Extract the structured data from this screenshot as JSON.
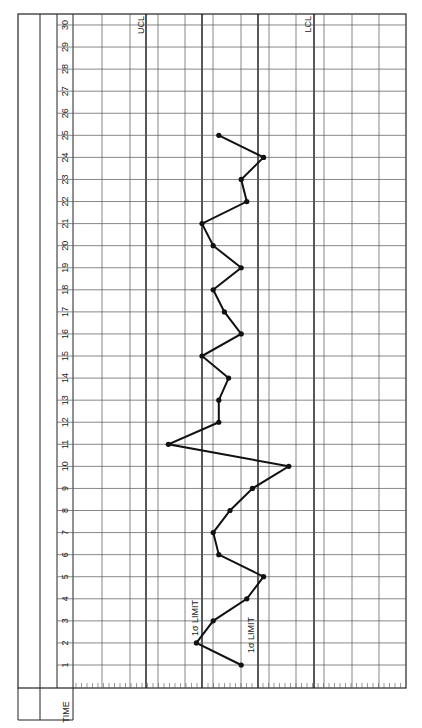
{
  "chart_data": {
    "type": "line",
    "orientation": "rotated-90 (time runs bottom to top, value runs left to right)",
    "title": "",
    "xlabel": "TIME",
    "ylabel": "",
    "time_ticks": [
      1,
      2,
      3,
      4,
      5,
      6,
      7,
      8,
      9,
      10,
      11,
      12,
      13,
      14,
      15,
      16,
      17,
      18,
      19,
      20,
      21,
      22,
      23,
      24,
      25,
      26,
      27,
      28,
      29,
      30
    ],
    "control_lines": [
      {
        "label": "UCL",
        "sigma": -3
      },
      {
        "label": "1σ LIMIT",
        "sigma": -1
      },
      {
        "label": "1σ LIMIT",
        "sigma": 1
      },
      {
        "label": "LCL",
        "sigma": 3
      }
    ],
    "value_units": "sigma from centerline (positive = toward LCL side / right)",
    "value_range": [
      -5.5,
      6.3
    ],
    "grid": true,
    "series": [
      {
        "name": "samples",
        "x": [
          1,
          2,
          3,
          4,
          5,
          6,
          7,
          8,
          9,
          10,
          11,
          12,
          13,
          14,
          15,
          16,
          17,
          18,
          19,
          20,
          21,
          22,
          23,
          24,
          25
        ],
        "values": [
          0.4,
          -1.2,
          -0.6,
          0.6,
          1.2,
          -0.4,
          -0.6,
          0.0,
          0.8,
          2.1,
          -2.2,
          -0.4,
          -0.4,
          -0.05,
          -1.0,
          0.4,
          -0.2,
          -0.6,
          0.4,
          -0.6,
          -1.0,
          0.6,
          0.4,
          1.2,
          -0.4
        ]
      }
    ]
  },
  "labels": {
    "time": "TIME",
    "ucl": "UCL",
    "lcl": "LCL",
    "sigma_upper": "1σ LIMIT",
    "sigma_lower": "1σ LIMIT"
  }
}
